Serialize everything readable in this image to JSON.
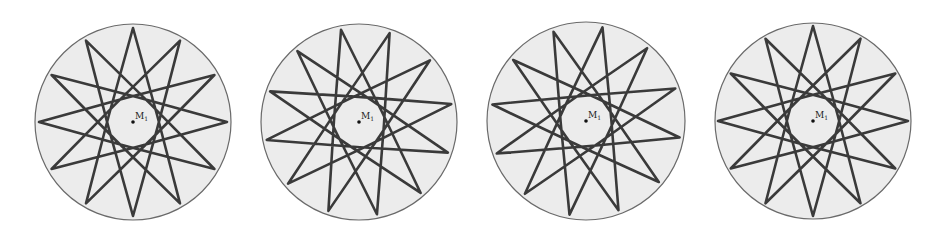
{
  "figure": {
    "width": 943,
    "height": 236,
    "background": "#ffffff",
    "disk_fill": "#ececec",
    "disk_stroke": "#6a6a6a",
    "curve_stroke": "#3a3a3a",
    "curve_width": 2.6,
    "star_points": 12,
    "star_step": 5,
    "edge_bulge": 0.06,
    "panels": [
      {
        "cx": 133,
        "cy": 122,
        "r": 98,
        "tip_r": 94,
        "rotation_deg": 0,
        "center_label": "M",
        "center_label_sub": "1"
      },
      {
        "cx": 359,
        "cy": 122,
        "r": 98,
        "tip_r": 94,
        "rotation_deg": -11,
        "center_label": "M",
        "center_label_sub": "1"
      },
      {
        "cx": 586,
        "cy": 121,
        "r": 99,
        "tip_r": 95,
        "rotation_deg": 10,
        "center_label": "M",
        "center_label_sub": "1"
      },
      {
        "cx": 813,
        "cy": 121,
        "r": 98,
        "tip_r": 95,
        "rotation_deg": 0,
        "center_label": "M",
        "center_label_sub": "1"
      }
    ]
  }
}
